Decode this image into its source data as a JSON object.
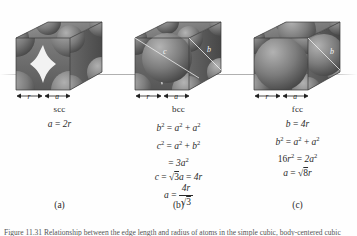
{
  "figure": {
    "caption": "Figure 11.31 Relationship between the edge length and radius of atoms in the simple cubic, body-centered cubic and face-centered cubic cells."
  },
  "panels": [
    {
      "key": "scc",
      "name": "scc",
      "tag": "(a)",
      "dim_r": "r",
      "dim_a": "a",
      "diagonal_labels": [],
      "equations": [
        {
          "id": "scc-eq1",
          "lhs": "a",
          "op": "=",
          "rhs": "2r"
        }
      ]
    },
    {
      "key": "bcc",
      "name": "bcc",
      "tag": "(b)",
      "dim_r": "r",
      "dim_a": "a",
      "diagonal_labels": [
        "c",
        "b"
      ],
      "equations": [
        {
          "id": "bcc-eq1",
          "text": "b2 = a2 + a2"
        },
        {
          "id": "bcc-eq2",
          "text": "c2 = a2 + b2"
        },
        {
          "id": "bcc-eq3",
          "text": "= 3a2"
        },
        {
          "id": "bcc-eq4",
          "text": "c = √3a = 4r"
        },
        {
          "id": "bcc-eq5",
          "text": "a = 4r/√3"
        }
      ]
    },
    {
      "key": "fcc",
      "name": "fcc",
      "tag": "(c)",
      "dim_r": "r",
      "dim_a": "a",
      "diagonal_labels": [
        "b"
      ],
      "equations": [
        {
          "id": "fcc-eq1",
          "text": "b = 4r"
        },
        {
          "id": "fcc-eq2",
          "text": "b2 = a2 + a2"
        },
        {
          "id": "fcc-eq3",
          "text": "16r2 = 2a2"
        },
        {
          "id": "fcc-eq4",
          "text": "a = √8r"
        }
      ]
    }
  ],
  "labels": {
    "scc_name": "scc",
    "bcc_name": "bcc",
    "fcc_name": "fcc",
    "tag_a": "(a)",
    "tag_b": "(b)",
    "tag_c": "(c)",
    "r": "r",
    "a": "a",
    "b": "b",
    "c": "c",
    "two_r": "2r",
    "four_r": "4r",
    "sixteen": "16",
    "three": "3",
    "two": "2",
    "eight": "8",
    "equals": "=",
    "plus": "+",
    "radical": "√"
  },
  "colors": {
    "background": "#fefefe",
    "cube_light": "#8d8d8d",
    "cube_mid": "#6e6e6e",
    "cube_dark": "#4c4c4c",
    "sphere_light": "#a5a5a5",
    "sphere_dark": "#454545",
    "gap_white": "#f2f2f2",
    "text": "#2a2a2a",
    "ground_line": "#969696"
  }
}
